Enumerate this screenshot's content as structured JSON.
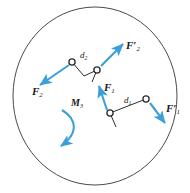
{
  "figure": {
    "name": "rigid-body-force-couple-diagram",
    "body_shape": "ellipse",
    "outline_color": "#4a4a4a",
    "arrow_color": "#3b9fd8",
    "label_color": "#1a1a1a",
    "background": "#ffffff"
  },
  "labels": {
    "force_2": {
      "symbol": "F",
      "sub": "2",
      "prime": ""
    },
    "force_2_prime": {
      "symbol": "F",
      "sub": "2",
      "prime": "′"
    },
    "force_1": {
      "symbol": "F",
      "sub": "1",
      "prime": ""
    },
    "force_1_prime": {
      "symbol": "F",
      "sub": "1",
      "prime": "′"
    },
    "distance_2": {
      "symbol": "d",
      "sub": "2"
    },
    "distance_1": {
      "symbol": "d",
      "sub": "1"
    },
    "moment_3": {
      "symbol": "M",
      "sub": "3"
    }
  },
  "elements": {
    "couple_2": {
      "name": "upper-couple",
      "pin_a": {
        "x": 72,
        "y": 62
      },
      "pin_b": {
        "x": 97,
        "y": 70
      },
      "force_arrow": {
        "from_x": 68,
        "from_y": 66,
        "to_x": 39,
        "to_y": 86
      },
      "force_prime_arrow": {
        "from_x": 101,
        "from_y": 66,
        "to_x": 124,
        "to_y": 43
      },
      "separation_label": "d2"
    },
    "couple_1": {
      "name": "lower-couple",
      "pin_a": {
        "x": 110,
        "y": 113
      },
      "pin_b": {
        "x": 146,
        "y": 99
      },
      "force_arrow": {
        "from_x": 106,
        "from_y": 109,
        "to_x": 98,
        "to_y": 85
      },
      "force_prime_arrow": {
        "from_x": 150,
        "from_y": 103,
        "to_x": 166,
        "to_y": 124
      },
      "separation_label": "d1"
    },
    "moment": {
      "name": "moment-arc",
      "direction": "clockwise",
      "label": "M3"
    }
  }
}
